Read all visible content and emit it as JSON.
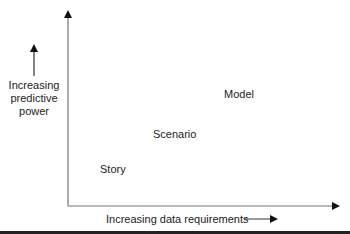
{
  "diagram": {
    "y_axis_label": [
      "Increasing",
      "predictive",
      "power"
    ],
    "x_axis_label": "Increasing data requirements",
    "points": [
      {
        "label": "Story"
      },
      {
        "label": "Scenario"
      },
      {
        "label": "Model"
      }
    ]
  }
}
